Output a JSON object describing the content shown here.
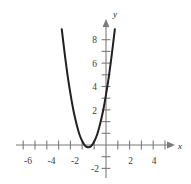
{
  "figure": {
    "kind": "cartesian-graph",
    "background": "#ffffff",
    "curve_color": "#231f20",
    "axis_color": "#7b7b7b",
    "tick_label_color": "#3b3b3b"
  },
  "axes": {
    "x_axis_label": "x",
    "y_axis_label": "y",
    "x_tick_labels": [
      "-6",
      "-4",
      "-2",
      "2",
      "4"
    ],
    "x_tick_values": [
      -6,
      -4,
      -2,
      2,
      4
    ],
    "x_all_ticks": [
      -7,
      -6,
      -5,
      -4,
      -3,
      -2,
      -1,
      1,
      2,
      3,
      4,
      5
    ],
    "y_tick_labels": [
      "8",
      "6",
      "4",
      "2",
      "-2"
    ],
    "y_tick_values": [
      8,
      6,
      4,
      2,
      -2
    ],
    "y_all_ticks": [
      1,
      2,
      3,
      4,
      5,
      6,
      7,
      8,
      9,
      -1,
      -2
    ],
    "x_range": [
      -7.2,
      5.6
    ],
    "y_range": [
      -2.6,
      9.6
    ],
    "origin_px": {
      "x": 106,
      "y": 145
    },
    "unit_px": {
      "x": 11.8,
      "y": 11.7
    },
    "arrow_x_end": "x",
    "arrow_y_end": "y"
  },
  "chart_data": {
    "type": "line",
    "title": "",
    "xlabel": "x",
    "ylabel": "y",
    "grid": false,
    "legend": null,
    "xlim": [
      -7.2,
      5.6
    ],
    "ylim": [
      -2.6,
      9.6
    ],
    "xticks": [
      -6,
      -4,
      -2,
      2,
      4
    ],
    "yticks": [
      8,
      6,
      4,
      2,
      -2
    ],
    "equation": "y = 2x^2 + 6x + 4.3",
    "vertex": [
      -1.5,
      -0.2
    ],
    "y_intercept": 4.3,
    "series": [
      {
        "name": "parabola",
        "color": "#231f20",
        "x": [
          -3.75,
          -3.5,
          -3.25,
          -3.0,
          -2.75,
          -2.5,
          -2.25,
          -2.0,
          -1.75,
          -1.5,
          -1.25,
          -1.0,
          -0.75,
          -0.5,
          -0.25,
          0.0,
          0.25,
          0.5,
          0.75,
          1.0,
          1.25
        ],
        "y": [
          9.9,
          7.8,
          5.9,
          4.3,
          2.9,
          1.8,
          0.9,
          0.3,
          -0.08,
          -0.2,
          -0.08,
          0.3,
          0.9,
          1.8,
          2.9,
          4.3,
          5.9,
          7.8,
          9.9,
          12.3,
          14.9
        ]
      }
    ]
  }
}
